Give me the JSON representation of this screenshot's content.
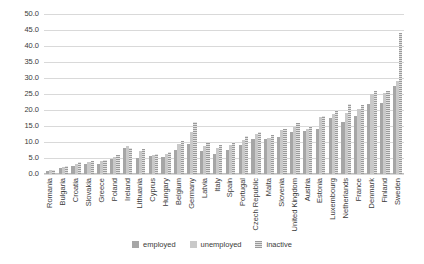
{
  "chart_data": {
    "type": "bar",
    "title": "",
    "xlabel": "",
    "ylabel": "",
    "ylim": [
      0,
      50
    ],
    "ytick_values": [
      0.0,
      5.0,
      10.0,
      15.0,
      20.0,
      25.0,
      30.0,
      35.0,
      40.0,
      45.0,
      50.0
    ],
    "ytick_labels": [
      "0.0",
      "5.0",
      "10.0",
      "15.0",
      "20.0",
      "25.0",
      "30.0",
      "35.0",
      "40.0",
      "45.0",
      "50.0"
    ],
    "grid": true,
    "legend_position": "bottom",
    "categories": [
      "Romania",
      "Bulgaria",
      "Croatia",
      "Slovakia",
      "Greece",
      "Poland",
      "Ireland",
      "Lithuania",
      "Cyprus",
      "Hungary",
      "Belgium",
      "Germany",
      "Latvia",
      "Italy",
      "Spain",
      "Portugal",
      "Czech Republic",
      "Malta",
      "Slovenia",
      "United Kingdom",
      "Austria",
      "Estonia",
      "Luxembourg",
      "Netherlands",
      "France",
      "Denmark",
      "Finland",
      "Sweden"
    ],
    "series": [
      {
        "name": "employed",
        "color": "#a6a6a6",
        "values": [
          1.0,
          2.0,
          2.4,
          3.0,
          3.2,
          4.6,
          8.2,
          5.0,
          5.6,
          5.2,
          7.5,
          9.5,
          7.2,
          6.2,
          7.6,
          9.2,
          10.8,
          11.0,
          11.6,
          13.0,
          13.5,
          14.2,
          17.5,
          16.2,
          18.0,
          22.0,
          22.2,
          27.5
        ]
      },
      {
        "name": "unemployed",
        "color": "#c9c9c9",
        "values": [
          1.2,
          2.2,
          3.2,
          3.6,
          4.0,
          5.4,
          8.6,
          7.2,
          5.8,
          6.2,
          9.5,
          13.0,
          8.6,
          8.0,
          9.2,
          10.6,
          12.4,
          11.4,
          13.6,
          14.6,
          14.0,
          17.8,
          18.8,
          19.0,
          20.4,
          25.0,
          25.2,
          29.0
        ]
      },
      {
        "name": "inactive",
        "color": "#bcbcbc",
        "values": [
          1.4,
          2.6,
          3.6,
          4.2,
          4.4,
          6.0,
          8.0,
          7.8,
          6.4,
          7.0,
          10.2,
          16.2,
          9.6,
          9.0,
          10.0,
          12.0,
          13.0,
          12.2,
          14.0,
          16.0,
          15.0,
          18.0,
          20.0,
          22.0,
          21.6,
          26.0,
          26.0,
          44.0
        ]
      }
    ],
    "legend": [
      "employed",
      "unemployed",
      "inactive"
    ]
  }
}
